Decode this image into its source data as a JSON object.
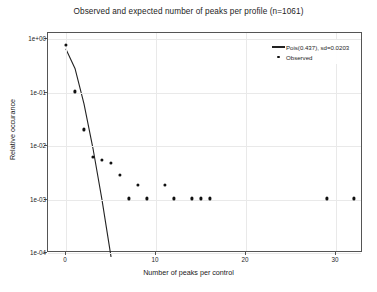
{
  "chart_data": {
    "type": "scatter",
    "title": "Observed and expected number of peaks per profile (n=1061)",
    "xlabel": "Number of peaks per control",
    "ylabel": "Relative occurance",
    "xlim": [
      -2,
      33
    ],
    "ylim": [
      0.0001,
      1.3
    ],
    "yscale": "log",
    "grid": true,
    "legend_position": "top-right",
    "xticks": [
      0,
      10,
      20,
      30
    ],
    "xtick_labels": [
      "0",
      "10",
      "20",
      "30"
    ],
    "yticks": [
      1,
      0.1,
      0.01,
      0.001,
      0.0001
    ],
    "ytick_labels": [
      "1e+00",
      "1e-01",
      "1e-02",
      "1e-03",
      "1e-04"
    ],
    "series": [
      {
        "name": "Pois(0.437), sd=0.0203",
        "type": "line",
        "lambda": 0.437,
        "sd": 0.0203,
        "x": [
          0,
          1,
          2,
          3,
          4,
          5
        ],
        "values": [
          0.646,
          0.2823,
          0.0617,
          0.00899,
          0.000982,
          8.58e-05
        ]
      },
      {
        "name": "Observed",
        "type": "scatter",
        "x": [
          0,
          1,
          2,
          3,
          4,
          5,
          6,
          7,
          8,
          9,
          11,
          12,
          14,
          15,
          16,
          29,
          32
        ],
        "values": [
          0.78,
          0.105,
          0.0205,
          0.0062,
          0.0055,
          0.0048,
          0.0029,
          0.00105,
          0.0019,
          0.00105,
          0.0019,
          0.00105,
          0.00105,
          0.00105,
          0.00105,
          0.00105,
          0.00105
        ]
      }
    ]
  },
  "legend": {
    "entries": [
      {
        "label": "Pois(0.437), sd=0.0203",
        "marker": "line"
      },
      {
        "label": "Observed",
        "marker": "dot"
      }
    ]
  }
}
